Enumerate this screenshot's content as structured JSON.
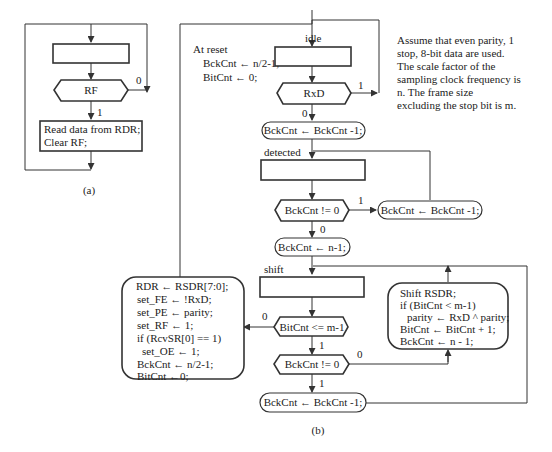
{
  "diagram_a": {
    "caption": "(a)",
    "decision": "RF",
    "branch_0": "0",
    "branch_1": "1",
    "action_lines": [
      "Read data from RDR;",
      "Clear RF;"
    ]
  },
  "diagram_b": {
    "caption": "(b)",
    "reset_title": "At reset",
    "reset_lines": [
      "BckCnt ← n/2-1;",
      "BitCnt ← 0;"
    ],
    "note_lines": [
      "Assume that even parity, 1",
      "stop, 8-bit data are used.",
      "The scale factor of the",
      "sampling clock frequency is",
      "n.  The frame size",
      "excluding the stop bit is m."
    ],
    "states": {
      "idle": "idle",
      "detected": "detected",
      "shift": "shift"
    },
    "decisions": {
      "rxd": "RxD",
      "bckcnt_nz_1": "BckCnt != 0",
      "bitcnt_le": "BitCnt <= m-1",
      "bckcnt_nz_2": "BckCnt != 0"
    },
    "actions": {
      "dec_idle": "BckCnt ← BckCnt -1;",
      "dec_detected": "BckCnt ← BckCnt -1;",
      "load_n1": "BckCnt ← n-1;",
      "dec_shift": "BckCnt ← BckCnt -1;"
    },
    "shift_box_lines": [
      "Shift RSDR;",
      "if (BitCnt < m-1)",
      "  parity ← RxD ^ parity;",
      "BitCnt ← BitCnt + 1;",
      "BckCnt ← n - 1;"
    ],
    "done_box_lines": [
      "RDR ← RSDR[7:0];",
      "set_FE ← !RxD;",
      "set_PE ← parity;",
      "set_RF ← 1;",
      "if (RcvSR[0] == 1)",
      "  set_OE ← 1;",
      "BckCnt ← n/2-1;",
      "BitCnt  ←0;"
    ],
    "labels": {
      "zero": "0",
      "one": "1"
    }
  }
}
